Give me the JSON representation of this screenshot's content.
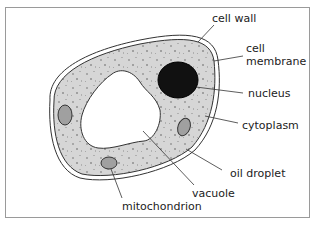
{
  "diagram": {
    "labels": {
      "cell_wall": "cell wall",
      "cell_membrane_1": "cell",
      "cell_membrane_2": "membrane",
      "nucleus": "nucleus",
      "cytoplasm": "cytoplasm",
      "oil_droplet": "oil droplet",
      "vacuole": "vacuole",
      "mitochondrion": "mitochondrion"
    },
    "colors": {
      "frame": "#9a9a9a",
      "cytoplasm": "#d6d6d6",
      "speckle": "#a8a8a8",
      "nucleus": "#111111",
      "organelle": "#a0a0a0",
      "outline": "#333333"
    }
  }
}
